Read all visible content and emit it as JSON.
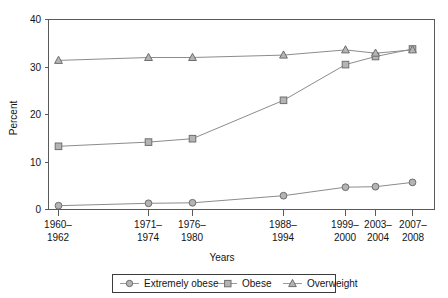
{
  "chart_data": {
    "type": "line",
    "title": "",
    "xlabel": "Years",
    "ylabel": "Percent",
    "categories": [
      "1960–\n1962",
      "1971–\n1974",
      "1976–\n1980",
      "1988–\n1994",
      "1999–\n2000",
      "2003–\n2004",
      "2007–\n2008"
    ],
    "category_labels_line1": [
      "1960–",
      "1971–",
      "1976–",
      "1988–",
      "1999–",
      "2003–",
      "2007–"
    ],
    "category_labels_line2": [
      "1962",
      "1974",
      "1980",
      "1994",
      "2000",
      "2004",
      "2008"
    ],
    "ylim": [
      0,
      40
    ],
    "yticks": [
      0,
      10,
      20,
      30,
      40
    ],
    "ytick_labels": [
      "0",
      "10",
      "20",
      "30",
      "40"
    ],
    "grid": false,
    "legend_position": "bottom",
    "series": [
      {
        "name": "Extremely obese",
        "marker": "circle",
        "values": [
          0.8,
          1.3,
          1.4,
          2.9,
          4.7,
          4.8,
          5.7
        ]
      },
      {
        "name": "Obese",
        "marker": "square",
        "values": [
          13.3,
          14.2,
          14.9,
          23.0,
          30.5,
          32.2,
          33.8
        ]
      },
      {
        "name": "Overweight",
        "marker": "triangle",
        "values": [
          31.4,
          32.0,
          32.0,
          32.5,
          33.6,
          32.9,
          33.6
        ]
      }
    ],
    "colors": {
      "line": "#8c8c8c",
      "marker_fill": "#b4b4b4",
      "marker_stroke": "#6e6e6e",
      "frame": "#5a5a5a",
      "text": "#141414"
    }
  },
  "legend": {
    "items": [
      {
        "label": "Extremely obese",
        "marker": "circle-marker-icon"
      },
      {
        "label": "Obese",
        "marker": "square-marker-icon"
      },
      {
        "label": "Overweight",
        "marker": "triangle-marker-icon"
      }
    ]
  }
}
